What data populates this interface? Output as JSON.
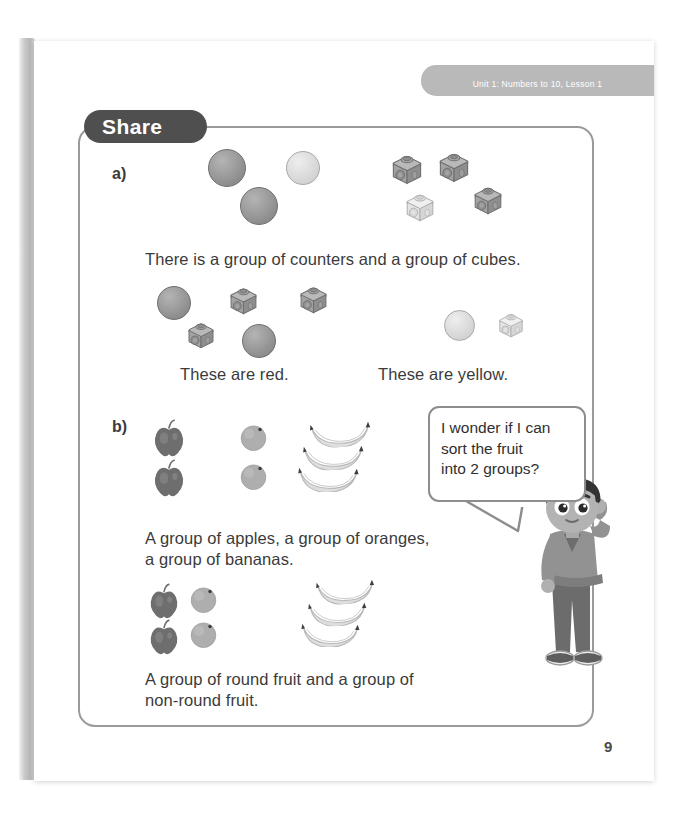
{
  "page": {
    "unit_tab": "Unit 1: Numbers to 10, Lesson 1",
    "section_title": "Share",
    "page_number": "9",
    "accent_dark": "#4f4f4f",
    "frame_border": "#9a9a9a",
    "text_color": "#3b3b3b"
  },
  "parts": {
    "a": {
      "label": "a)",
      "caption_1": "There is a group of counters and a group of cubes.",
      "caption_red": "These are red.",
      "caption_yellow": "These are yellow.",
      "top_group": {
        "counters": [
          {
            "color": "red",
            "size": 38,
            "x": 208,
            "y": 149
          },
          {
            "color": "yellow",
            "size": 34,
            "x": 286,
            "y": 151
          },
          {
            "color": "red",
            "size": 38,
            "x": 240,
            "y": 187
          }
        ],
        "cubes": [
          {
            "color": "red",
            "size": 34,
            "x": 390,
            "y": 152
          },
          {
            "color": "red",
            "size": 34,
            "x": 437,
            "y": 150
          },
          {
            "color": "yellow",
            "size": 32,
            "x": 404,
            "y": 191
          },
          {
            "color": "red",
            "size": 32,
            "x": 472,
            "y": 184
          }
        ]
      },
      "red_group": {
        "counters": [
          {
            "color": "red",
            "size": 34,
            "x": 157,
            "y": 286
          },
          {
            "color": "red",
            "size": 34,
            "x": 242,
            "y": 324
          }
        ],
        "cubes": [
          {
            "color": "red",
            "size": 31,
            "x": 228,
            "y": 285
          },
          {
            "color": "red",
            "size": 31,
            "x": 298,
            "y": 284
          },
          {
            "color": "red",
            "size": 30,
            "x": 186,
            "y": 320
          }
        ]
      },
      "yellow_group": {
        "counters": [
          {
            "color": "yellow",
            "size": 31,
            "x": 444,
            "y": 310
          }
        ],
        "cubes": [
          {
            "color": "yellow",
            "size": 28,
            "x": 497,
            "y": 311
          }
        ]
      }
    },
    "b": {
      "label": "b)",
      "caption_1": "A group of apples, a group of oranges,",
      "caption_2": "a group of bananas.",
      "caption_3": "A group of round fruit and a group of",
      "caption_4": "non-round fruit.",
      "speech": {
        "line_1": "I wonder if I can",
        "line_2": "sort the fruit",
        "line_3": "into 2 groups?"
      },
      "sorted_by_type": {
        "apples": [
          {
            "x": 152,
            "y": 419,
            "size": 34
          },
          {
            "x": 152,
            "y": 459,
            "size": 34
          }
        ],
        "oranges": [
          {
            "x": 239,
            "y": 423,
            "size": 29
          },
          {
            "x": 239,
            "y": 462,
            "size": 29
          }
        ],
        "bananas": [
          {
            "x": 307,
            "y": 421,
            "w": 66,
            "h": 26,
            "rot": -4
          },
          {
            "x": 300,
            "y": 444,
            "w": 66,
            "h": 26,
            "rot": -2
          },
          {
            "x": 295,
            "y": 466,
            "w": 66,
            "h": 26,
            "rot": 0
          }
        ]
      },
      "sorted_by_shape": {
        "round": [
          {
            "kind": "apple",
            "x": 148,
            "y": 583,
            "size": 32
          },
          {
            "kind": "orange",
            "x": 189,
            "y": 585,
            "size": 29
          },
          {
            "kind": "apple",
            "x": 148,
            "y": 619,
            "size": 32
          },
          {
            "kind": "orange",
            "x": 189,
            "y": 620,
            "size": 29
          }
        ],
        "non_round": [
          {
            "kind": "banana",
            "x": 313,
            "y": 579,
            "w": 64,
            "h": 25,
            "rot": -4
          },
          {
            "kind": "banana",
            "x": 305,
            "y": 601,
            "w": 64,
            "h": 25,
            "rot": -2
          },
          {
            "kind": "banana",
            "x": 298,
            "y": 622,
            "w": 64,
            "h": 25,
            "rot": 0
          }
        ]
      }
    }
  },
  "icons": {
    "counter": "counter-disc-icon",
    "cube": "linking-cube-icon",
    "apple": "apple-icon",
    "orange": "orange-icon",
    "banana": "banana-icon",
    "character": "thinking-boy-character"
  }
}
